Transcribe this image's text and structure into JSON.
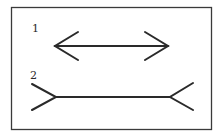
{
  "diagram": {
    "type": "muller-lyer-illusion",
    "stroke_color": "#2a2a2a",
    "frame_color": "#3a3a3a",
    "background": "#ffffff",
    "figures": [
      {
        "label": "1",
        "arrowheads": "inward-pointing-outward",
        "description": "Line with arrowheads pointing outward (closed fins)"
      },
      {
        "label": "2",
        "arrowheads": "fins-outward",
        "description": "Line with outward-splaying tails (open fins)"
      }
    ]
  }
}
